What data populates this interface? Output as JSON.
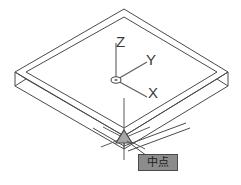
{
  "app": {
    "type": "cad-3d-isometric-view",
    "background_color": "#ffffff",
    "line_color": "#4a4a4a",
    "title": "3D Isometric Plate with Midpoint Object Snap"
  },
  "ucs_icon": {
    "name": "ucs-axis-indicator",
    "origin_marker": "small-ellipse",
    "axes": [
      {
        "id": "z",
        "label": "Z",
        "direction": "up"
      },
      {
        "id": "y",
        "label": "Y",
        "direction": "upper-right"
      },
      {
        "id": "x",
        "label": "X",
        "direction": "lower-right"
      }
    ]
  },
  "model": {
    "name": "isometric-plate",
    "shape": "flat-rectangular-box",
    "faces": [
      "top",
      "front-left-side",
      "front-right-side"
    ],
    "edge_color": "#4a4a4a"
  },
  "crosshair": {
    "name": "cad-crosshair-cursor",
    "x": 124,
    "y": 138,
    "color": "#5a5a5a"
  },
  "osnap": {
    "marker": {
      "name": "midpoint-snap-marker",
      "glyph": "triangle",
      "color": "#6e6e6e",
      "x": 124,
      "y": 138
    },
    "tooltip": {
      "label": "中点",
      "background_color": "#8c8c8c",
      "border_color": "#4a4a4a",
      "text_color": "#1c1c1c"
    },
    "leader_line": {
      "name": "tooltip-leader-line",
      "from_x": 127,
      "from_y": 141,
      "to_x": 146,
      "to_y": 156
    }
  }
}
